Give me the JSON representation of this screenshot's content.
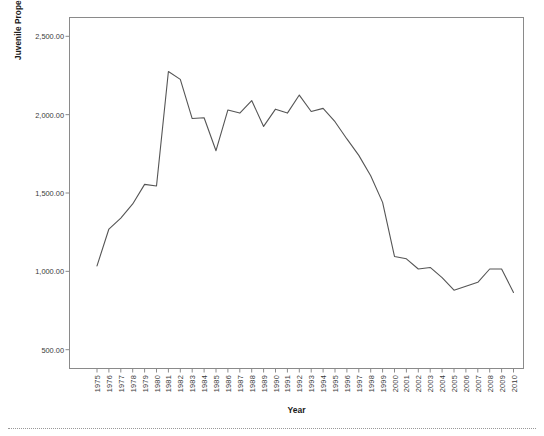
{
  "chart_data": {
    "type": "line",
    "title": "",
    "xlabel": "Year",
    "ylabel": "Juvenile Property Arrest Rate per 100,000",
    "ylim": [
      380,
      2620
    ],
    "yticks": [
      500,
      1000,
      1500,
      2000,
      2500
    ],
    "ytick_labels": [
      "500.00",
      "1,000.00",
      "1,500.00",
      "2,000.00",
      "2,500.00"
    ],
    "grid": false,
    "legend": "none",
    "line_color": "#555555",
    "categories": [
      "1975",
      "1976",
      "1977",
      "1978",
      "1979",
      "1980",
      "1981",
      "1982",
      "1983",
      "1984",
      "1985",
      "1986",
      "1987",
      "1988",
      "1989",
      "1990",
      "1991",
      "1992",
      "1993",
      "1994",
      "1995",
      "1996",
      "1997",
      "1998",
      "1999",
      "2000",
      "2001",
      "2002",
      "2003",
      "2004",
      "2005",
      "2006",
      "2007",
      "2008",
      "2009",
      "2010"
    ],
    "values": [
      1035,
      1270,
      1340,
      1430,
      1555,
      1545,
      2275,
      2225,
      1975,
      1980,
      1770,
      2030,
      2010,
      2090,
      1925,
      2035,
      2010,
      2125,
      2020,
      2040,
      1955,
      1845,
      1740,
      1610,
      1440,
      1095,
      1080,
      1015,
      1025,
      960,
      880,
      905,
      930,
      1015,
      1015,
      865
    ]
  },
  "axis": {
    "x_title": "Year",
    "y_title": "Juvenile Property Arrest Rate per 100,000"
  }
}
